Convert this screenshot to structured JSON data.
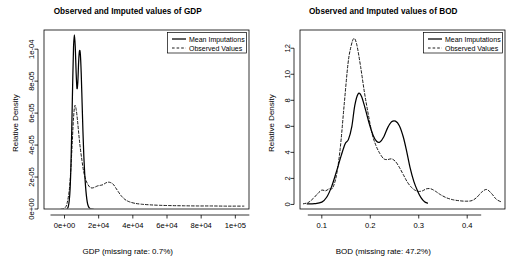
{
  "figure": {
    "width": 511,
    "height": 262,
    "background": "#ffffff",
    "foreground": "#000000",
    "panel_count": 2
  },
  "chart_data": [
    {
      "type": "line",
      "id": "gdp-density-plot",
      "title": "Observed and Imputed values of GDP",
      "xlabel": "GDP (missing rate: 0.7%)",
      "ylabel": "Relative Density",
      "xlim": [
        -12000,
        108000
      ],
      "ylim": [
        0,
        0.000112
      ],
      "grid": false,
      "legend_position": "top-right",
      "xticks": [
        0,
        20000,
        40000,
        60000,
        80000,
        100000
      ],
      "xticklabels": [
        "0e+00",
        "2e+04",
        "4e+04",
        "6e+04",
        "8e+04",
        "1e+05"
      ],
      "yticks": [
        0,
        2e-05,
        4e-05,
        6e-05,
        8e-05,
        0.0001
      ],
      "yticklabels": [
        "0e+00",
        "2e-05",
        "4e-05",
        "6e-05",
        "8e-05",
        "1e-04"
      ],
      "series": [
        {
          "name": "Mean Imputations",
          "style": "solid",
          "color": "#000000",
          "x": [
            1500,
            2200,
            2800,
            3300,
            3800,
            4300,
            4800,
            5300,
            5800,
            6300,
            6800,
            7300,
            7800,
            8300,
            8800,
            9300,
            9800,
            10300,
            10800,
            11300,
            11800,
            12300,
            12800,
            13300,
            13800,
            14300,
            14800,
            15300,
            15800,
            16300,
            16800
          ],
          "y": [
            0.0,
            1.5e-06,
            5.5e-06,
            1.3e-05,
            2.8e-05,
            5.25e-05,
            7.95e-05,
            0.0001015,
            0.000109,
            0.0001015,
            8.55e-05,
            7.55e-05,
            7.95e-05,
            9.25e-05,
            9.9e-05,
            9.65e-05,
            8.45e-05,
            6.65e-05,
            4.85e-05,
            3.35e-05,
            2.25e-05,
            1.45e-05,
            8.5e-06,
            4.5e-06,
            2.2e-06,
            1e-06,
            4e-07,
            1e-07,
            0.0,
            0.0,
            0.0
          ]
        },
        {
          "name": "Observed Values",
          "style": "dashed",
          "color": "#000000",
          "x": [
            -2000,
            0,
            1500,
            3000,
            4200,
            5200,
            6000,
            6800,
            7600,
            8400,
            9200,
            10200,
            11200,
            12400,
            13600,
            15000,
            16500,
            18000,
            19500,
            21000,
            22500,
            24000,
            25500,
            27000,
            28500,
            30000,
            31500,
            33000,
            34500,
            36000,
            38000,
            41000,
            45000,
            50000,
            56000,
            63000,
            70000,
            78000,
            86000,
            94000,
            100000,
            105000
          ],
          "y": [
            0.0,
            5e-07,
            3.5e-06,
            1.4e-05,
            3.45e-05,
            5.55e-05,
            6.45e-05,
            6.25e-05,
            5.55e-05,
            4.65e-05,
            3.85e-05,
            3.05e-05,
            2.35e-05,
            1.85e-05,
            1.55e-05,
            1.35e-05,
            1.32e-05,
            1.38e-05,
            1.45e-05,
            1.48e-05,
            1.52e-05,
            1.62e-05,
            1.68e-05,
            1.65e-05,
            1.55e-05,
            1.32e-05,
            1.08e-05,
            8.5e-06,
            6.8e-06,
            5.5e-06,
            4.5e-06,
            3.6e-06,
            3e-06,
            2.6e-06,
            2.3e-06,
            2.1e-06,
            2e-06,
            1.9e-06,
            1.9e-06,
            1.8e-06,
            1.8e-06,
            1.8e-06
          ]
        }
      ]
    },
    {
      "type": "line",
      "id": "bod-density-plot",
      "title": "Observed and Imputed values of BOD",
      "xlabel": "BOD (missing rate: 47.2%)",
      "ylabel": "Relative Density",
      "xlim": [
        0.055,
        0.478
      ],
      "ylim": [
        -0.35,
        13.4
      ],
      "grid": false,
      "legend_position": "top-right",
      "xticks": [
        0.1,
        0.2,
        0.3,
        0.4
      ],
      "xticklabels": [
        "0.1",
        "0.2",
        "0.3",
        "0.4"
      ],
      "yticks": [
        0,
        2,
        4,
        6,
        8,
        10,
        12
      ],
      "yticklabels": [
        "0",
        "2",
        "4",
        "6",
        "8",
        "10",
        "12"
      ],
      "series": [
        {
          "name": "Mean Imputations",
          "style": "solid",
          "color": "#000000",
          "x": [
            0.07,
            0.085,
            0.1,
            0.11,
            0.12,
            0.13,
            0.14,
            0.148,
            0.155,
            0.162,
            0.168,
            0.175,
            0.182,
            0.19,
            0.198,
            0.206,
            0.213,
            0.22,
            0.228,
            0.236,
            0.244,
            0.252,
            0.26,
            0.268,
            0.275,
            0.282,
            0.29,
            0.298,
            0.305,
            0.312,
            0.318
          ],
          "y": [
            0.04,
            0.06,
            0.18,
            0.55,
            1.35,
            2.5,
            3.75,
            4.65,
            5.0,
            6.0,
            7.6,
            8.5,
            8.3,
            7.3,
            6.2,
            5.3,
            4.85,
            4.8,
            5.2,
            5.9,
            6.35,
            6.4,
            6.05,
            5.2,
            4.1,
            2.85,
            1.75,
            1.0,
            0.5,
            0.2,
            0.1
          ]
        },
        {
          "name": "Observed Values",
          "style": "dashed",
          "color": "#000000",
          "x": [
            0.062,
            0.072,
            0.082,
            0.092,
            0.1,
            0.108,
            0.115,
            0.122,
            0.13,
            0.138,
            0.146,
            0.154,
            0.16,
            0.166,
            0.172,
            0.18,
            0.188,
            0.196,
            0.204,
            0.212,
            0.22,
            0.228,
            0.236,
            0.244,
            0.252,
            0.26,
            0.268,
            0.276,
            0.284,
            0.292,
            0.3,
            0.308,
            0.316,
            0.325,
            0.335,
            0.345,
            0.358,
            0.372,
            0.385,
            0.398,
            0.41,
            0.42,
            0.43,
            0.44,
            0.45,
            0.46,
            0.47
          ],
          "y": [
            0.05,
            0.15,
            0.45,
            0.85,
            1.1,
            1.05,
            1.2,
            1.25,
            2.2,
            4.3,
            7.6,
            10.8,
            12.1,
            12.75,
            12.3,
            10.6,
            8.6,
            6.9,
            5.4,
            4.5,
            3.9,
            3.5,
            3.45,
            3.5,
            3.3,
            2.85,
            2.3,
            1.75,
            1.35,
            1.1,
            1.0,
            1.05,
            1.2,
            1.2,
            1.0,
            0.75,
            0.5,
            0.35,
            0.28,
            0.25,
            0.3,
            0.55,
            0.95,
            1.15,
            0.85,
            0.4,
            0.2
          ]
        }
      ]
    }
  ],
  "legend": {
    "items": [
      {
        "label": "Mean Imputations",
        "style": "solid"
      },
      {
        "label": "Observed Values",
        "style": "dashed"
      }
    ]
  }
}
